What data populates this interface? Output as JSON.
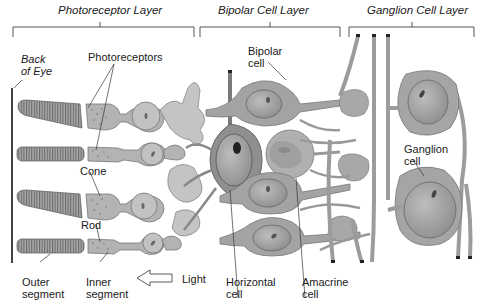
{
  "layers": [
    {
      "label": "Photoreceptor Layer"
    },
    {
      "label": "Bipolar Cell Layer"
    },
    {
      "label": "Ganglion Cell Layer"
    }
  ],
  "labels": {
    "back_of_eye": "Back\nof Eye",
    "photoreceptors": "Photoreceptors",
    "cone": "Cone",
    "rod": "Rod",
    "outer_segment": "Outer\nsegment",
    "inner_segment": "Inner\nsegment",
    "light": "Light",
    "horizontal_cell": "Horizontal\ncell",
    "amacrine_cell": "Amacrine\ncell",
    "bipolar_cell": "Bipolar\ncell",
    "ganglion_cell": "Ganglion\ncell"
  },
  "colors": {
    "cell_fill": "#b3b3b3",
    "cell_fill_light": "#c9c9c9",
    "cell_fill_dark": "#8f8f8f",
    "nucleus": "#9a9a9a",
    "outline": "#6e6e6e",
    "text": "#1a1a1a"
  }
}
